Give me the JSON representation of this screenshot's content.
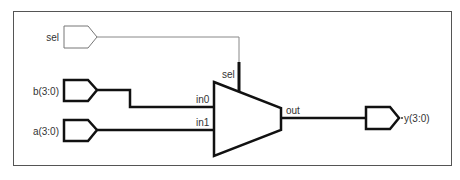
{
  "diagram": {
    "type": "multiplexer-schematic",
    "ports": {
      "sel": {
        "label": "sel",
        "direction": "input",
        "width": 1
      },
      "b": {
        "label": "b(3:0)",
        "direction": "input",
        "width": 4
      },
      "a": {
        "label": "a(3:0)",
        "direction": "input",
        "width": 4
      },
      "y": {
        "label": "y(3:0)",
        "direction": "output",
        "width": 4
      }
    },
    "mux": {
      "pins": {
        "sel": "sel",
        "in0": "in0",
        "in1": "in1",
        "out": "out"
      }
    },
    "connections": [
      {
        "from": "sel",
        "to": "mux.sel"
      },
      {
        "from": "b(3:0)",
        "to": "mux.in0"
      },
      {
        "from": "a(3:0)",
        "to": "mux.in1"
      },
      {
        "from": "mux.out",
        "to": "y(3:0)"
      }
    ],
    "colors": {
      "border": "#555555",
      "thin_wire": "#888888",
      "bus_wire": "#111111",
      "label": "#333333"
    }
  }
}
